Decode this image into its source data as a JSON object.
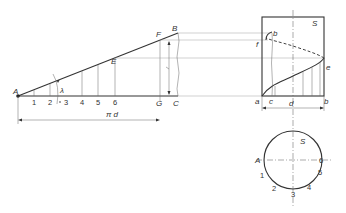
{
  "figure": {
    "points": {
      "A": "A",
      "B": "B",
      "C": "C",
      "E": "E",
      "F": "F",
      "G": "G",
      "a": "a",
      "b": "b",
      "c": "c",
      "e": "e",
      "f": "f"
    },
    "angle_label": "λ",
    "divisions": [
      "1",
      "2",
      "3",
      "4",
      "5",
      "6"
    ],
    "circumference_label": "π d",
    "diameter_label": "d",
    "section_label": "S",
    "circle_labels": {
      "A": "A",
      "S": "S",
      "points": [
        "1",
        "2",
        "3",
        "4",
        "5",
        "6"
      ]
    },
    "colors": {
      "line": "#333333",
      "thin": "#666666",
      "background": "#ffffff"
    }
  }
}
